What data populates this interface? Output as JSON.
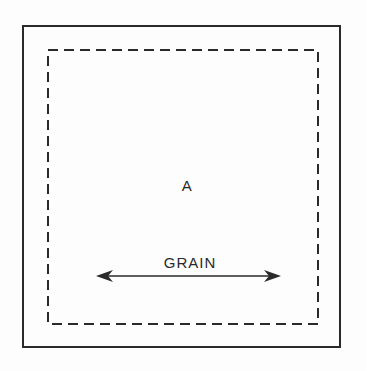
{
  "diagram": {
    "panel_label": "A",
    "grain_label": "GRAIN",
    "arrow": {
      "type": "double-headed",
      "direction": "horizontal"
    },
    "outline": {
      "outer": "solid",
      "inner": "dashed"
    },
    "colors": {
      "line": "#2a2a2a",
      "background": "#fdfdfd"
    }
  }
}
